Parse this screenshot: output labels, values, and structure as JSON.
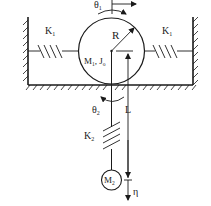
{
  "diagram": {
    "type": "mechanical-system",
    "labels": {
      "theta1": "θ",
      "theta1_sub": "1",
      "K1_left": "K",
      "K1_left_sub": "1",
      "K1_right": "K",
      "K1_right_sub": "1",
      "R": "R",
      "M1J0": "M",
      "M1_sub": "1",
      "J_part": ", J",
      "J_sub": "o",
      "theta2": "θ",
      "theta2_sub": "2",
      "L": "L",
      "K2": "K",
      "K2_sub": "2",
      "M2": "M",
      "M2_sub": "2",
      "eta": "η"
    },
    "colors": {
      "stroke": "#1a1a1a",
      "background": "#ffffff"
    }
  }
}
